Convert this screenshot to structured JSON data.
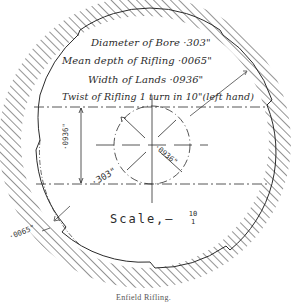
{
  "figure": {
    "caption": "Enfield Rifling.",
    "specs": [
      {
        "label": "Diameter of Bore",
        "value": "·303\""
      },
      {
        "label": "Mean depth of Rifling",
        "value": "·0065\""
      },
      {
        "label": "Width of Lands",
        "value": "·0936\""
      },
      {
        "label": "Twist of Rifling",
        "value": "1 turn in 10\" (left hand)"
      }
    ],
    "spec_lines": [
      "Diameter of Bore ·303\"",
      "Mean depth of Rifling  ·0065\"",
      "Width of Lands  ·0936\"",
      "Twist of Rifling 1 turn in 10\"(left hand)"
    ],
    "dimension_labels": {
      "vertical_land": "·0936\"",
      "bore_diameter": "·303\"",
      "land_width_diag": "·0936\"",
      "groove_depth": "·0065\""
    },
    "scale": {
      "label": "Scale,–",
      "numerator": "10",
      "denominator": "1"
    },
    "colors": {
      "ink": "#2b2b2b",
      "paper": "#ffffff",
      "hatch": "#3a3a3a"
    }
  }
}
